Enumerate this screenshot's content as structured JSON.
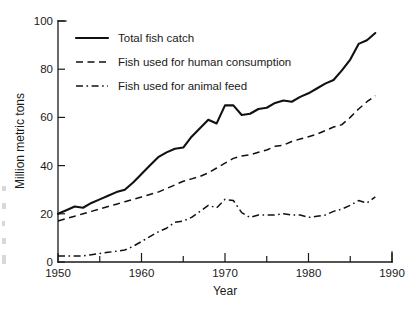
{
  "chart_data": {
    "type": "line",
    "title": "",
    "xlabel": "Year",
    "ylabel": "Million metric tons",
    "xlim": [
      1950,
      1990
    ],
    "ylim": [
      0,
      100
    ],
    "xticks": [
      1950,
      1960,
      1970,
      1980,
      1990
    ],
    "xtick_labels": [
      "1950",
      "1960",
      "1970",
      "1980",
      "1990"
    ],
    "xminor_ticks": [
      1955,
      1965,
      1975,
      1985
    ],
    "yticks": [
      0,
      20,
      40,
      60,
      80,
      100
    ],
    "ytick_labels": [
      "0",
      "20",
      "40",
      "60",
      "80",
      "100"
    ],
    "yminor_ticks": [
      10,
      30,
      50,
      70,
      90
    ],
    "grid": false,
    "legend_position": "upper left",
    "x": [
      1950,
      1951,
      1952,
      1953,
      1954,
      1955,
      1956,
      1957,
      1958,
      1959,
      1960,
      1961,
      1962,
      1963,
      1964,
      1965,
      1966,
      1967,
      1968,
      1969,
      1970,
      1971,
      1972,
      1973,
      1974,
      1975,
      1976,
      1977,
      1978,
      1979,
      1980,
      1981,
      1982,
      1983,
      1984,
      1985,
      1986,
      1987,
      1988
    ],
    "series": [
      {
        "name": "Total fish catch",
        "style": "solid",
        "values": [
          20,
          21.5,
          23,
          22.5,
          24.5,
          26,
          27.5,
          29,
          30,
          33,
          36.5,
          40,
          43.5,
          45.5,
          47,
          47.5,
          52,
          55.5,
          59,
          57.5,
          65,
          65,
          61,
          61.5,
          63.5,
          64,
          66,
          67,
          66.5,
          68.5,
          70,
          72,
          74,
          75.5,
          79.5,
          84,
          90.5,
          92,
          95
        ]
      },
      {
        "name": "Fish used for human consumption",
        "style": "dashed",
        "values": [
          17,
          18,
          19,
          20,
          21,
          22,
          23,
          24,
          25,
          26,
          27,
          28,
          29,
          30.5,
          32,
          33.5,
          34.5,
          35.5,
          37,
          39,
          41,
          43,
          44,
          44.5,
          45.5,
          46.5,
          48,
          48.5,
          50,
          51,
          52,
          53,
          54.5,
          56,
          57,
          60,
          63.5,
          66.5,
          69
        ]
      },
      {
        "name": "Fish used for animal feed",
        "style": "dashdot",
        "values": [
          2.5,
          2.5,
          2.5,
          2.5,
          3,
          3.5,
          4,
          4.5,
          5,
          6.5,
          8.5,
          10.5,
          12.5,
          14,
          16.5,
          17,
          18.5,
          21,
          23.5,
          22.5,
          26,
          25.5,
          20.5,
          18.5,
          19.5,
          19.5,
          19.5,
          20,
          19.5,
          19.5,
          18.5,
          19,
          19.5,
          21,
          22,
          23.5,
          25.5,
          24.5,
          27
        ]
      }
    ]
  },
  "legend": {
    "items": [
      {
        "label": "Total fish catch",
        "style": "solid"
      },
      {
        "label": "Fish used for human consumption",
        "style": "dashed"
      },
      {
        "label": "Fish used for animal feed",
        "style": "dashdot"
      }
    ]
  },
  "axes": {
    "y_title": "Million metric tons",
    "x_title": "Year"
  }
}
